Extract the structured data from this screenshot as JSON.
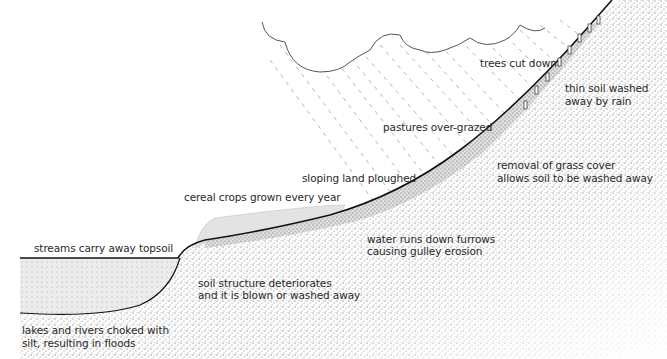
{
  "diagram": {
    "type": "cross-section illustration",
    "labels": {
      "trees": "trees cut down",
      "thin_soil_1": "thin soil washed",
      "thin_soil_2": "away by rain",
      "pastures": "pastures over-grazed",
      "grass_1": "removal of grass cover",
      "grass_2": "allows soil to be washed away",
      "ploughed": "sloping land ploughed",
      "cereal": "cereal crops grown every year",
      "furrows_1": "water runs down furrows",
      "furrows_2": "causing gulley erosion",
      "streams": "streams carry away topsoil",
      "structure_1": "soil structure deteriorates",
      "structure_2": "and it is blown or washed away",
      "lakes_1": "lakes and rivers choked with",
      "lakes_2": "silt, resulting in floods"
    },
    "elements": [
      "cloud",
      "rain",
      "tree-stumps",
      "hillslope",
      "cereal-crops",
      "river-silt"
    ]
  }
}
